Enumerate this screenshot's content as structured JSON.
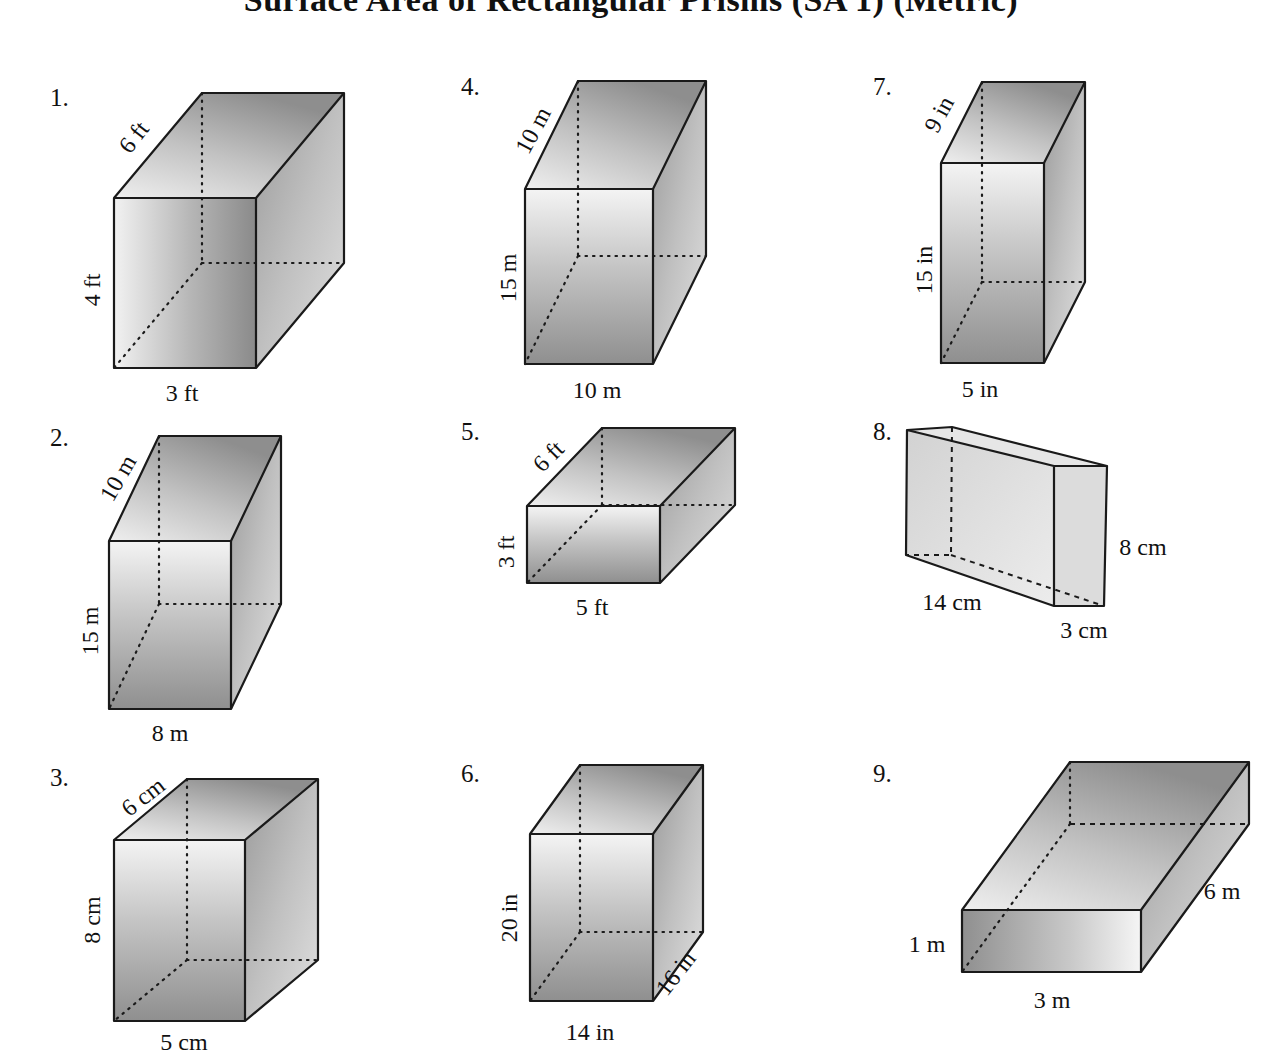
{
  "worksheet": {
    "title": "Surface Area of Rectangular Prisms (SA 1) (Metric)",
    "figure_style": {
      "edge_color": "#1a1a1a",
      "face_light": "#f2f2f2",
      "face_mid": "#bdbdbd",
      "face_dark": "#8c8c8c"
    },
    "problems": [
      {
        "number": "1.",
        "numPos": [
          50,
          106
        ],
        "front": [
          114,
          198,
          256,
          368
        ],
        "depth": [
          88,
          -105
        ],
        "frontGradient": "horizontal",
        "labels": [
          {
            "text": "6 ft",
            "x": 140,
            "y": 142,
            "rotate": -52
          },
          {
            "text": "4 ft",
            "x": 100,
            "y": 290,
            "rotate": -90
          },
          {
            "text": "3 ft",
            "x": 182,
            "y": 401,
            "rotate": 0
          }
        ]
      },
      {
        "number": "2.",
        "numPos": [
          50,
          446
        ],
        "front": [
          109,
          541,
          231,
          709
        ],
        "depth": [
          50,
          -105
        ],
        "frontGradient": "vertical",
        "labels": [
          {
            "text": "10 m",
            "x": 125,
            "y": 482,
            "rotate": -60
          },
          {
            "text": "15 m",
            "x": 98,
            "y": 631,
            "rotate": -90
          },
          {
            "text": "8 m",
            "x": 170,
            "y": 741,
            "rotate": 0
          }
        ]
      },
      {
        "number": "3.",
        "numPos": [
          50,
          786
        ],
        "front": [
          114,
          840,
          245,
          1021
        ],
        "depth": [
          73,
          -61
        ],
        "frontGradient": "vertical",
        "labels": [
          {
            "text": "6 cm",
            "x": 148,
            "y": 803,
            "rotate": -38
          },
          {
            "text": "8 cm",
            "x": 100,
            "y": 920,
            "rotate": -90
          },
          {
            "text": "5 cm",
            "x": 184,
            "y": 1050,
            "rotate": 0
          }
        ]
      },
      {
        "number": "4.",
        "numPos": [
          461,
          95
        ],
        "front": [
          525,
          189,
          653,
          364
        ],
        "depth": [
          53,
          -108
        ],
        "frontGradient": "vertical",
        "labels": [
          {
            "text": "10 m",
            "x": 540,
            "y": 134,
            "rotate": -62
          },
          {
            "text": "15 m",
            "x": 516,
            "y": 278,
            "rotate": -90
          },
          {
            "text": "10 m",
            "x": 597,
            "y": 398,
            "rotate": 0
          }
        ]
      },
      {
        "number": "5.",
        "numPos": [
          461,
          440
        ],
        "front": [
          527,
          506,
          660,
          583
        ],
        "depth": [
          75,
          -78
        ],
        "frontGradient": "vertical",
        "labels": [
          {
            "text": "6 ft",
            "x": 554,
            "y": 462,
            "rotate": -45
          },
          {
            "text": "3 ft",
            "x": 514,
            "y": 552,
            "rotate": -90
          },
          {
            "text": "5 ft",
            "x": 592,
            "y": 615,
            "rotate": 0
          }
        ]
      },
      {
        "number": "6.",
        "numPos": [
          461,
          782
        ],
        "front": [
          530,
          834,
          653,
          1001
        ],
        "depth": [
          50,
          -69
        ],
        "frontGradient": "vertical",
        "labels": [
          {
            "text": "20 in",
            "x": 517,
            "y": 918,
            "rotate": -90
          },
          {
            "text": "14 in",
            "x": 590,
            "y": 1040,
            "rotate": 0
          },
          {
            "text": "16 in",
            "x": 682,
            "y": 978,
            "rotate": -52
          }
        ]
      },
      {
        "number": "7.",
        "numPos": [
          873,
          95
        ],
        "front": [
          941,
          163,
          1044,
          363
        ],
        "depth": [
          41,
          -81
        ],
        "frontGradient": "vertical",
        "labels": [
          {
            "text": "9 in",
            "x": 946,
            "y": 118,
            "rotate": -62
          },
          {
            "text": "15 in",
            "x": 932,
            "y": 270,
            "rotate": -90
          },
          {
            "text": "5 in",
            "x": 980,
            "y": 397,
            "rotate": 0
          }
        ]
      },
      {
        "number": "8.",
        "numPos": [
          873,
          440
        ],
        "slab": true,
        "labels": [
          {
            "text": "8 cm",
            "x": 1143,
            "y": 555,
            "rotate": 0
          },
          {
            "text": "14 cm",
            "x": 952,
            "y": 610,
            "rotate": 0
          },
          {
            "text": "3 cm",
            "x": 1084,
            "y": 638,
            "rotate": 0
          }
        ]
      },
      {
        "number": "9.",
        "numPos": [
          873,
          782
        ],
        "front": [
          962,
          910,
          1141,
          972
        ],
        "depth": [
          108,
          -148
        ],
        "frontGradient": "horizontal-dark-left",
        "labels": [
          {
            "text": "6 m",
            "x": 1222,
            "y": 899,
            "rotate": 0
          },
          {
            "text": "1 m",
            "x": 927,
            "y": 952,
            "rotate": 0
          },
          {
            "text": "3 m",
            "x": 1052,
            "y": 1008,
            "rotate": 0
          }
        ]
      }
    ]
  }
}
